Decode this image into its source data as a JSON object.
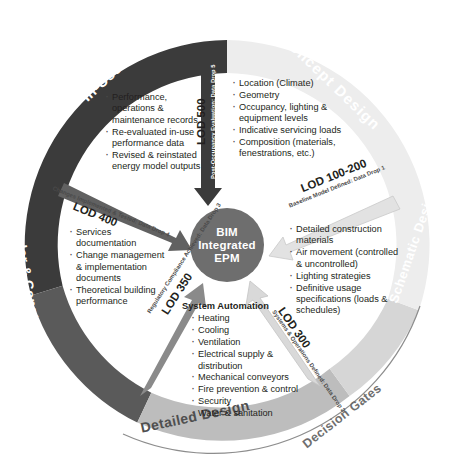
{
  "diagram": {
    "hub": {
      "line1": "BIM",
      "line2": "Integrated",
      "line3": "EPM"
    },
    "colors": {
      "in_use_ring": "#3b3b3b",
      "tender_ring": "#5a5a5a",
      "concept_ring": "#ededed",
      "schematic_ring": "#d6d6d6",
      "detailed_ring": "#bdbdbd",
      "hub_fill": "#6e6e6e",
      "text": "#231f20"
    }
  },
  "ring_labels": [
    {
      "name": "in-use",
      "text": "In-Use"
    },
    {
      "name": "concept-design",
      "text": "Concept Design"
    },
    {
      "name": "tender-construction",
      "text": "Tender & Construction"
    },
    {
      "name": "schematic-design",
      "text": "Schematic Design"
    },
    {
      "name": "detailed-design",
      "text": "Detailed Design"
    },
    {
      "name": "decision-gates",
      "text": "Decision Gates"
    }
  ],
  "data_drops": [
    {
      "name": "data-drop-5",
      "lod": "LOD 500",
      "caption": "Post-Occupancy Evaluation: Data Drop 5"
    },
    {
      "name": "data-drop-1",
      "lod": "LOD 100-200",
      "caption": "Baseline Model Defined: Data Drop 1"
    },
    {
      "name": "data-drop-4",
      "lod": "LOD 400",
      "caption": "Changes Implemented & Tested: Data Drop 4"
    },
    {
      "name": "data-drop-2",
      "lod": "LOD 300",
      "caption": "Systems & Operations Defined: Data Drop 2"
    },
    {
      "name": "data-drop-3",
      "lod": "LOD 350",
      "caption": "Regulatory Compliance Achieved: Data Drop 3"
    }
  ],
  "content_blocks": {
    "in_use": {
      "heading": "",
      "items": [
        "Performance, operations & maintenance records",
        "Re-evaluated in-use performance data",
        "Revised & reinstated energy model outputs"
      ]
    },
    "concept_design": {
      "heading": "",
      "items": [
        "Location (Climate)",
        "Geometry",
        "Occupancy, lighting & equipment levels",
        "Indicative servicing loads",
        "Composition (materials, fenestrations, etc.)"
      ]
    },
    "tender_construction": {
      "heading": "",
      "items": [
        "Services documentation",
        "Change management & implementation documents",
        "Theoretical building performance"
      ]
    },
    "schematic_design": {
      "heading": "",
      "items": [
        "Detailed construction materials",
        "Air movement (controlled & uncontrolled)",
        "Lighting strategies",
        "Definitive usage specifications (loads & schedules)"
      ]
    },
    "detailed_design": {
      "heading": "System Automation",
      "items": [
        "Heating",
        "Cooling",
        "Ventilation",
        "Electrical supply & distribution",
        "Mechanical conveyors",
        "Fire prevention & control",
        "Security",
        "Water & sanitation"
      ]
    }
  }
}
